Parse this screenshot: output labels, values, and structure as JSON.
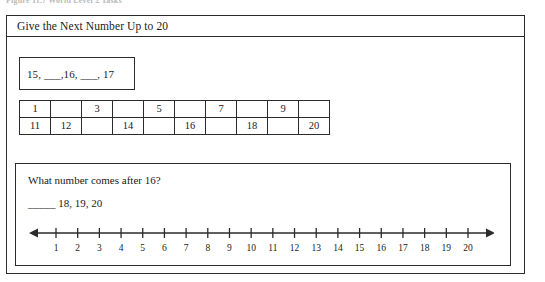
{
  "figure_caption": "Figure 11.7  World Level 2 Tasks",
  "worksheet": {
    "title": "Give the Next Number Up to 20",
    "sequence_box": {
      "text": "15, ___,16, ___, 17"
    },
    "number_grid": {
      "rows": [
        [
          "1",
          "",
          "3",
          "",
          "5",
          "",
          "7",
          "",
          "9",
          ""
        ],
        [
          "11",
          "12",
          "",
          "14",
          "",
          "16",
          "",
          "18",
          "",
          "20"
        ]
      ]
    },
    "question_panel": {
      "question": "What number comes after 16?",
      "answer_line": "_____  18, 19, 20",
      "number_line": {
        "labels": [
          "1",
          "2",
          "3",
          "4",
          "5",
          "6",
          "7",
          "8",
          "9",
          "10",
          "11",
          "12",
          "13",
          "14",
          "15",
          "16",
          "17",
          "18",
          "19",
          "20"
        ],
        "left_arrow": true,
        "right_arrow": true
      }
    }
  },
  "colors": {
    "ink": "#2b2b2b",
    "paper": "#ffffff"
  }
}
